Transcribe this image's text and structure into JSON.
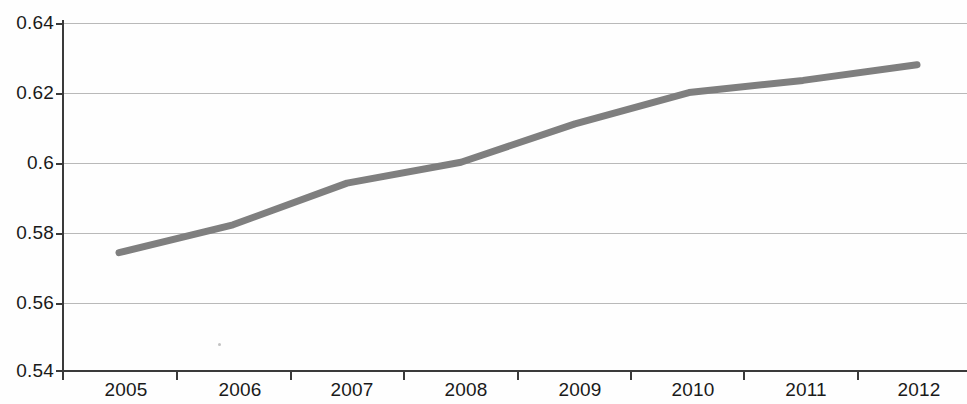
{
  "chart_data": {
    "type": "line",
    "title": "",
    "xlabel": "",
    "ylabel": "",
    "categories": [
      "2005",
      "2006",
      "2007",
      "2008",
      "2009",
      "2010",
      "2011",
      "2012"
    ],
    "x": [
      2005,
      2006,
      2007,
      2008,
      2009,
      2010,
      2011,
      2012
    ],
    "values": [
      0.574,
      0.582,
      0.594,
      0.6,
      0.611,
      0.62,
      0.6235,
      0.628
    ],
    "series": [
      {
        "name": "",
        "values": [
          0.574,
          0.582,
          0.594,
          0.6,
          0.611,
          0.62,
          0.6235,
          0.628
        ],
        "color": "#7f7f7f",
        "line_width": 7
      }
    ],
    "ylim": [
      0.54,
      0.64
    ],
    "yticks": [
      0.54,
      0.56,
      0.58,
      0.6,
      0.62,
      0.64
    ],
    "ytick_labels": [
      "0.54",
      "0.56",
      "0.58",
      "0.6",
      "0.62",
      "0.64"
    ],
    "xtick_labels": [
      "2005",
      "2006",
      "2007",
      "2008",
      "2009",
      "2010",
      "2011",
      "2012"
    ],
    "grid": true,
    "grid_axis": "y",
    "grid_color": "#b9b9b9",
    "legend": false,
    "legend_position": "none",
    "axis_color": "#3a3a3a",
    "background_color": "#fefefe",
    "markers": false,
    "annotations": []
  },
  "axes": {
    "y_labels": [
      "0.64",
      "0.62",
      "0.6",
      "0.58",
      "0.56",
      "0.54"
    ],
    "x_labels": [
      "2005",
      "2006",
      "2007",
      "2008",
      "2009",
      "2010",
      "2011",
      "2012"
    ]
  }
}
